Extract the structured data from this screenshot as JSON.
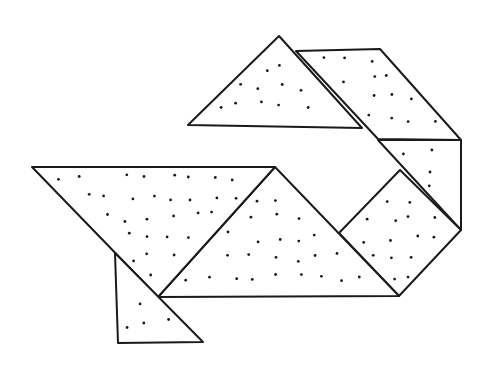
{
  "diagram": {
    "type": "tangram-figure",
    "stroke_color": "#1a1a1a",
    "fill_color": "#ffffff",
    "dot_color": "#1a1a1a",
    "pieces": [
      {
        "name": "top-triangle",
        "points": [
          [
            279,
            36
          ],
          [
            188,
            125
          ],
          [
            362,
            128
          ]
        ]
      },
      {
        "name": "parallelogram",
        "points": [
          [
            296,
            51
          ],
          [
            380,
            49
          ],
          [
            461,
            140
          ],
          [
            378,
            139
          ]
        ]
      },
      {
        "name": "small-triangle-right",
        "points": [
          [
            378,
            140
          ],
          [
            461,
            140
          ],
          [
            461,
            230
          ]
        ]
      },
      {
        "name": "square",
        "points": [
          [
            400,
            170
          ],
          [
            461,
            230
          ],
          [
            399,
            296
          ],
          [
            339,
            233
          ]
        ]
      },
      {
        "name": "large-triangle-middle",
        "points": [
          [
            275,
            167
          ],
          [
            158,
            297
          ],
          [
            399,
            296
          ]
        ]
      },
      {
        "name": "large-triangle-left",
        "points": [
          [
            32,
            167
          ],
          [
            275,
            167
          ],
          [
            158,
            297
          ]
        ]
      },
      {
        "name": "small-triangle-bottom",
        "points": [
          [
            115,
            253
          ],
          [
            118,
            343
          ],
          [
            203,
            342
          ]
        ]
      }
    ]
  }
}
